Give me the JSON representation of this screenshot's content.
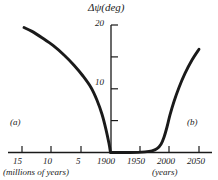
{
  "chart_data": {
    "type": "line",
    "title": "",
    "ylabel": "Δψ(deg)",
    "xlabel_left": "(millions of years)",
    "xlabel_right": "(years)",
    "ylim": [
      0,
      20
    ],
    "yticks": [
      0,
      5,
      10,
      15,
      20
    ],
    "ytick_labels": [
      "",
      "",
      "10",
      "",
      "20"
    ],
    "grid": false,
    "legend": false,
    "annotations": [
      {
        "text": "(a)",
        "x_frac": 0.05,
        "y_frac": 0.66
      },
      {
        "text": "(b)",
        "x_frac": 0.86,
        "y_frac": 0.66
      }
    ],
    "xticks_left": [
      {
        "label": "15",
        "px": 22
      },
      {
        "label": "10",
        "px": 51
      },
      {
        "label": "5",
        "px": 81
      },
      {
        "label": "1900",
        "px": 110
      }
    ],
    "xticks_right": [
      {
        "label": "1950",
        "px": 140
      },
      {
        "label": "2000",
        "px": 169
      },
      {
        "label": "2050",
        "px": 199
      }
    ],
    "series": [
      {
        "name": "(a) past obliquity change",
        "points": [
          {
            "x": 24,
            "y": 19.6
          },
          {
            "x": 32,
            "y": 19.0
          },
          {
            "x": 42,
            "y": 18.0
          },
          {
            "x": 53,
            "y": 16.8
          },
          {
            "x": 64,
            "y": 15.3
          },
          {
            "x": 74,
            "y": 13.7
          },
          {
            "x": 83,
            "y": 12.0
          },
          {
            "x": 91,
            "y": 10.2
          },
          {
            "x": 97,
            "y": 8.2
          },
          {
            "x": 102,
            "y": 6.0
          },
          {
            "x": 106,
            "y": 3.6
          },
          {
            "x": 109,
            "y": 1.4
          },
          {
            "x": 110.5,
            "y": 0.0
          }
        ]
      },
      {
        "name": "(b) future obliquity change",
        "points": [
          {
            "x": 111,
            "y": 0.0
          },
          {
            "x": 130,
            "y": 0.0
          },
          {
            "x": 145,
            "y": 0.1
          },
          {
            "x": 152,
            "y": 0.25
          },
          {
            "x": 157,
            "y": 0.6
          },
          {
            "x": 161,
            "y": 1.3
          },
          {
            "x": 164,
            "y": 2.4
          },
          {
            "x": 167,
            "y": 4.0
          },
          {
            "x": 170,
            "y": 5.9
          },
          {
            "x": 174,
            "y": 8.0
          },
          {
            "x": 179,
            "y": 10.2
          },
          {
            "x": 185,
            "y": 12.4
          },
          {
            "x": 192,
            "y": 14.5
          },
          {
            "x": 199,
            "y": 16.2
          }
        ]
      }
    ],
    "colors": {
      "curve": "#1a1a1a",
      "axis": "#1a1a1a",
      "background": "#ffffff"
    }
  }
}
